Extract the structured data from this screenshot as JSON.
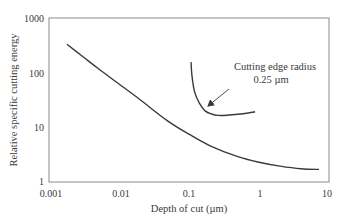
{
  "chart_data": {
    "type": "line",
    "title": "",
    "xlabel": "Depth of cut (µm)",
    "ylabel": "Relative specific cutting energy",
    "xscale": "log",
    "yscale": "log",
    "xlim": [
      0.001,
      10
    ],
    "ylim": [
      1,
      1000
    ],
    "grid": false,
    "legend": null,
    "x_ticks": [
      "0.001",
      "0.01",
      "0.1",
      "1",
      "10"
    ],
    "y_ticks": [
      "1",
      "10",
      "100",
      "1000"
    ],
    "series": [
      {
        "name": "Specific cutting energy (general)",
        "points": [
          [
            0.0018,
            330
          ],
          [
            0.003,
            200
          ],
          [
            0.005,
            120
          ],
          [
            0.01,
            62
          ],
          [
            0.02,
            32
          ],
          [
            0.05,
            13
          ],
          [
            0.1,
            7.5
          ],
          [
            0.2,
            4.6
          ],
          [
            0.5,
            2.9
          ],
          [
            1,
            2.3
          ],
          [
            2,
            1.95
          ],
          [
            4,
            1.75
          ],
          [
            7.2,
            1.7
          ]
        ]
      },
      {
        "name": "Cutting edge radius 0.25 µm",
        "points": [
          [
            0.107,
            156
          ],
          [
            0.11,
            90
          ],
          [
            0.12,
            45
          ],
          [
            0.14,
            28
          ],
          [
            0.17,
            20
          ],
          [
            0.21,
            17.5
          ],
          [
            0.26,
            16.5
          ],
          [
            0.35,
            16.6
          ],
          [
            0.5,
            17.3
          ],
          [
            0.7,
            18.3
          ],
          [
            0.88,
            19.2
          ]
        ]
      }
    ],
    "annotations": [
      {
        "text_line1": "Cutting edge radius",
        "text_line2": "0.25 µm",
        "arrow_to": [
          0.23,
          17.5
        ]
      }
    ],
    "colors": {
      "line": "#3a3a3a",
      "axis": "#7a7a7a",
      "text": "#3a3a3a"
    }
  }
}
